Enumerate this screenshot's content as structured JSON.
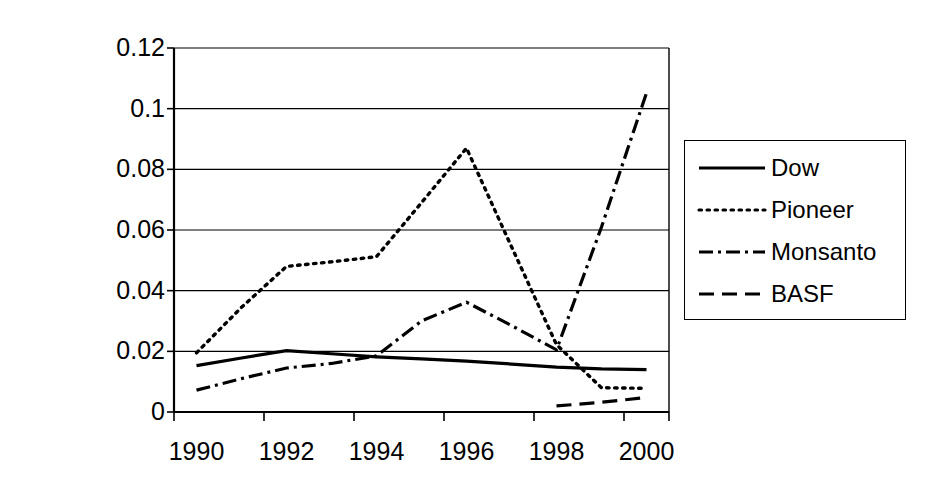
{
  "chart_data": {
    "type": "line",
    "title": "",
    "xlabel": "",
    "ylabel": "Per $1000 Net Sales",
    "x": [
      1990,
      1991,
      1992,
      1993,
      1994,
      1995,
      1996,
      1997,
      1998,
      1999,
      2000
    ],
    "xtick_labels": [
      "1990",
      "1992",
      "1994",
      "1996",
      "1998",
      "2000"
    ],
    "xtick_values": [
      1990,
      1992,
      1994,
      1996,
      1998,
      2000
    ],
    "ytick_labels": [
      "0",
      "0.02",
      "0.04",
      "0.06",
      "0.08",
      "0.1",
      "0.12"
    ],
    "ytick_values": [
      0,
      0.02,
      0.04,
      0.06,
      0.08,
      0.1,
      0.12
    ],
    "ylim": [
      0,
      0.12
    ],
    "grid": "horizontal",
    "legend_position": "right",
    "series": [
      {
        "name": "Dow",
        "style": "solid",
        "x": [
          1990,
          1991,
          1992,
          1993,
          1994,
          1995,
          1996,
          1997,
          1998,
          1999,
          2000
        ],
        "values": [
          0.0153,
          0.0178,
          0.0202,
          0.0192,
          0.0182,
          0.0175,
          0.0168,
          0.0158,
          0.0148,
          0.0142,
          0.014
        ]
      },
      {
        "name": "Pioneer",
        "style": "dotted",
        "x": [
          1990,
          1991,
          1992,
          1993,
          1994,
          1995,
          1996,
          1997,
          1998,
          1999,
          2000
        ],
        "values": [
          0.0195,
          0.0345,
          0.048,
          0.0495,
          0.0512,
          0.069,
          0.087,
          0.0545,
          0.0222,
          0.008,
          0.0078
        ]
      },
      {
        "name": "Monsanto",
        "style": "dash-dot",
        "x": [
          1990,
          1991,
          1992,
          1993,
          1994,
          1995,
          1996,
          1997,
          1998,
          1999,
          2000
        ],
        "values": [
          0.0072,
          0.011,
          0.0145,
          0.016,
          0.0185,
          0.03,
          0.0362,
          0.0285,
          0.0205,
          0.061,
          0.1052
        ]
      },
      {
        "name": "BASF",
        "style": "dashed",
        "x": [
          1998,
          1999,
          2000
        ],
        "values": [
          0.002,
          0.0032,
          0.0048
        ]
      }
    ]
  },
  "legend": {
    "items": [
      {
        "label": "Dow",
        "style": "solid"
      },
      {
        "label": "Pioneer",
        "style": "dotted"
      },
      {
        "label": "Monsanto",
        "style": "dash-dot"
      },
      {
        "label": "BASF",
        "style": "dashed"
      }
    ]
  }
}
